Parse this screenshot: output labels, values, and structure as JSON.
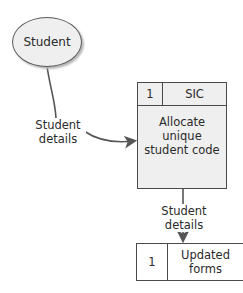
{
  "entity": {
    "label": "Student"
  },
  "process": {
    "id": "1",
    "code": "SIC",
    "description": "Allocate unique student code"
  },
  "data_store": {
    "id": "1",
    "name": "Updated forms"
  },
  "flows": [
    {
      "from": "Student",
      "to": "Allocate unique student code",
      "label_line1": "Student",
      "label_line2": "details"
    },
    {
      "from": "Allocate unique student code",
      "to": "Updated forms",
      "label_line1": "Student",
      "label_line2": "details"
    }
  ],
  "colors": {
    "fill": "#efefef",
    "stroke": "#4a4a4a",
    "arrow": "#555555"
  }
}
